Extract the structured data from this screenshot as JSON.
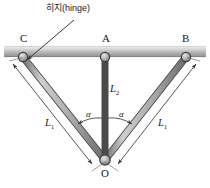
{
  "figure": {
    "callout": {
      "text": "히지(hinge)",
      "x": 46,
      "y": 4
    },
    "points": [
      {
        "id": "C",
        "label": "C",
        "x": 23,
        "y": 57,
        "label_x": 20,
        "label_y": 33
      },
      {
        "id": "A",
        "label": "A",
        "x": 105,
        "y": 57,
        "label_x": 102,
        "label_y": 33
      },
      {
        "id": "B",
        "label": "B",
        "x": 186,
        "y": 57,
        "label_x": 182,
        "label_y": 33
      },
      {
        "id": "O",
        "label": "O",
        "x": 105,
        "y": 160,
        "label_x": 101,
        "label_y": 168
      }
    ],
    "members": [
      {
        "id": "CO",
        "length_label": "L",
        "length_sub": "1",
        "label_x": 45,
        "label_y": 118
      },
      {
        "id": "AO",
        "length_label": "L",
        "length_sub": "2",
        "label_x": 110,
        "label_y": 84
      },
      {
        "id": "BO",
        "length_label": "L",
        "length_sub": "1",
        "label_x": 158,
        "label_y": 118
      }
    ],
    "angles": [
      {
        "id": "alpha-left",
        "label": "α",
        "x": 86,
        "y": 110
      },
      {
        "id": "alpha-right",
        "label": "α",
        "x": 119,
        "y": 110
      }
    ],
    "support_bar": {
      "label": "support-bar",
      "y_top": 46,
      "y_bottom": 57
    },
    "colors": {
      "member_fill": "#b8b8b8",
      "member_stroke": "#4a4a4a",
      "bar_light": "#f0f0f0",
      "bar_dark": "#9a9a9a",
      "line": "#3a3a3a",
      "text": "#1a1a1a",
      "background": "#ffffff"
    }
  }
}
